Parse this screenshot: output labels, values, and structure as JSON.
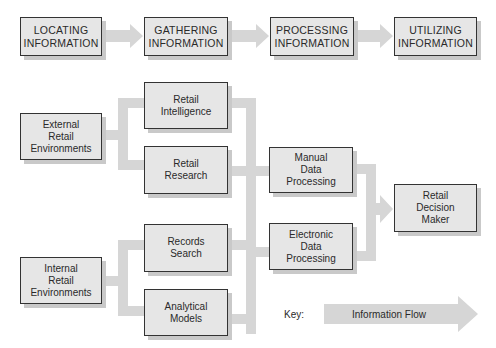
{
  "stages": [
    {
      "line1": "LOCATING",
      "line2": "INFORMATION"
    },
    {
      "line1": "GATHERING",
      "line2": "INFORMATION"
    },
    {
      "line1": "PROCESSING",
      "line2": "INFORMATION"
    },
    {
      "line1": "UTILIZING",
      "line2": "INFORMATION"
    }
  ],
  "sources": {
    "external": {
      "lines": [
        "External",
        "Retail",
        "Environments"
      ]
    },
    "internal": {
      "lines": [
        "Internal",
        "Retail",
        "Environments"
      ]
    }
  },
  "gathering": {
    "intelligence": {
      "lines": [
        "Retail",
        "Intelligence"
      ]
    },
    "research": {
      "lines": [
        "Retail",
        "Research"
      ]
    },
    "records": {
      "lines": [
        "Records",
        "Search"
      ]
    },
    "models": {
      "lines": [
        "Analytical",
        "Models"
      ]
    }
  },
  "processing": {
    "manual": {
      "lines": [
        "Manual",
        "Data",
        "Processing"
      ]
    },
    "electronic": {
      "lines": [
        "Electronic",
        "Data",
        "Processing"
      ]
    }
  },
  "decision": {
    "lines": [
      "Retail",
      "Decision",
      "Maker"
    ]
  },
  "key": {
    "label": "Key:",
    "text": "Information Flow"
  },
  "colors": {
    "flow": "#d4d4d4",
    "box_fill": "#e6e6e6",
    "box_border": "#333333",
    "shadow": "#c9c9c9"
  }
}
